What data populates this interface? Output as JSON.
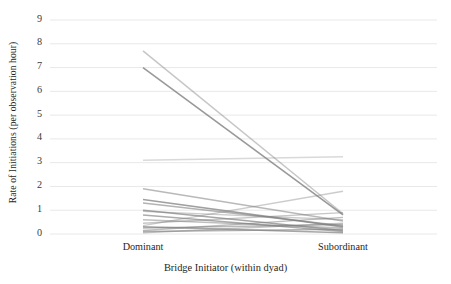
{
  "chart_data": {
    "type": "line",
    "title": "",
    "subtitle": "",
    "xlabel": "Bridge Initiator (within dyad)",
    "ylabel": "Rate of Initiations (per observation hour)",
    "categories": [
      "Dominant",
      "Subordinant"
    ],
    "xtick_labels": [
      "Dominant",
      "Subordinant"
    ],
    "ytick_labels": [
      "0",
      "1",
      "2",
      "3",
      "4",
      "5",
      "6",
      "7",
      "8",
      "9"
    ],
    "ylim": [
      0,
      9
    ],
    "ytick_values": [
      0,
      1,
      2,
      3,
      4,
      5,
      6,
      7,
      8,
      9
    ],
    "grid": "horizontal",
    "legend": "none",
    "annotations": [],
    "line_color": "#808080",
    "grid_color": "#e8e8e8",
    "series": [
      {
        "name": "dyad-1",
        "values": [
          7.7,
          0.85
        ],
        "opacity": 0.45,
        "width": 1.5
      },
      {
        "name": "dyad-2",
        "values": [
          7.0,
          0.8
        ],
        "opacity": 0.8,
        "width": 1.6
      },
      {
        "name": "dyad-3",
        "values": [
          3.1,
          3.25
        ],
        "opacity": 0.3,
        "width": 1.4
      },
      {
        "name": "dyad-4",
        "values": [
          1.9,
          0.55
        ],
        "opacity": 0.55,
        "width": 1.5
      },
      {
        "name": "dyad-5",
        "values": [
          1.45,
          0.3
        ],
        "opacity": 0.75,
        "width": 1.6
      },
      {
        "name": "dyad-6",
        "values": [
          1.3,
          0.35
        ],
        "opacity": 0.6,
        "width": 1.5
      },
      {
        "name": "dyad-7",
        "values": [
          1.0,
          0.15
        ],
        "opacity": 0.7,
        "width": 1.5
      },
      {
        "name": "dyad-8",
        "values": [
          0.95,
          0.6
        ],
        "opacity": 0.4,
        "width": 1.4
      },
      {
        "name": "dyad-9",
        "values": [
          0.8,
          0.1
        ],
        "opacity": 0.65,
        "width": 1.5
      },
      {
        "name": "dyad-10",
        "values": [
          0.6,
          0.25
        ],
        "opacity": 0.5,
        "width": 1.4
      },
      {
        "name": "dyad-11",
        "values": [
          0.45,
          0.9
        ],
        "opacity": 0.45,
        "width": 1.4
      },
      {
        "name": "dyad-12",
        "values": [
          0.35,
          1.8
        ],
        "opacity": 0.4,
        "width": 1.4
      },
      {
        "name": "dyad-13",
        "values": [
          0.3,
          0.05
        ],
        "opacity": 0.7,
        "width": 1.5
      },
      {
        "name": "dyad-14",
        "values": [
          0.25,
          0.4
        ],
        "opacity": 0.55,
        "width": 1.4
      },
      {
        "name": "dyad-15",
        "values": [
          0.15,
          0.7
        ],
        "opacity": 0.5,
        "width": 1.4
      },
      {
        "name": "dyad-16",
        "values": [
          0.1,
          0.2
        ],
        "opacity": 0.6,
        "width": 1.5
      },
      {
        "name": "dyad-17",
        "values": [
          0.05,
          0.45
        ],
        "opacity": 0.45,
        "width": 1.4
      }
    ]
  },
  "axes": {
    "y_title": "Rate of Initiations (per observation hour)",
    "x_title": "Bridge Initiator (within dyad)"
  }
}
